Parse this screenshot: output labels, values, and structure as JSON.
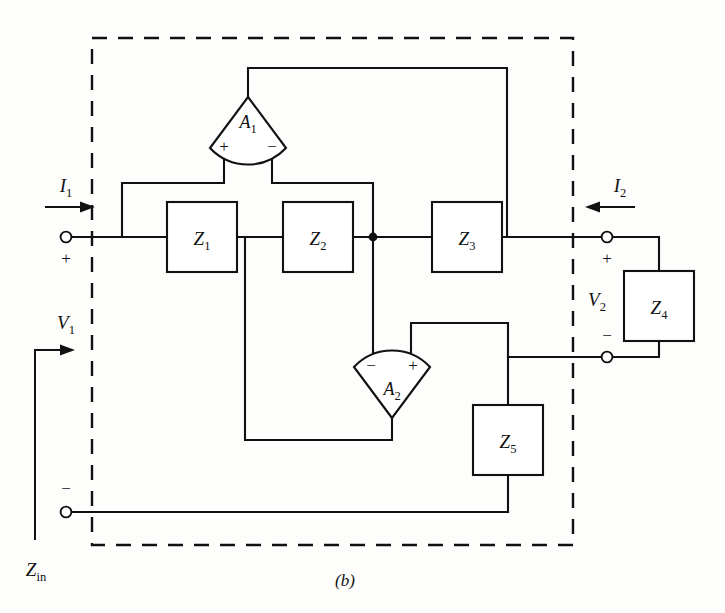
{
  "figure": {
    "caption": "(b)",
    "type": "circuit-schematic"
  },
  "ports": {
    "input": {
      "current_label": "I",
      "current_sub": "1",
      "voltage_label": "V",
      "voltage_sub": "1",
      "plus_sign": "+",
      "minus_sign": "−",
      "impedance_label": "Z",
      "impedance_sub": "in",
      "current_direction": "right"
    },
    "output": {
      "current_label": "I",
      "current_sub": "2",
      "voltage_label": "V",
      "voltage_sub": "2",
      "plus_sign": "+",
      "minus_sign": "−",
      "current_direction": "left"
    }
  },
  "impedances": [
    {
      "label": "Z",
      "sub": "1"
    },
    {
      "label": "Z",
      "sub": "2"
    },
    {
      "label": "Z",
      "sub": "3"
    },
    {
      "label": "Z",
      "sub": "4"
    },
    {
      "label": "Z",
      "sub": "5"
    }
  ],
  "amplifiers": [
    {
      "label": "A",
      "sub": "1",
      "orientation": "apex-up",
      "left_input_sign": "+",
      "right_input_sign": "−"
    },
    {
      "label": "A",
      "sub": "2",
      "orientation": "apex-down",
      "left_input_sign": "−",
      "right_input_sign": "+"
    }
  ],
  "colors": {
    "ink": "#111111",
    "paper": "#fdfdfc"
  }
}
